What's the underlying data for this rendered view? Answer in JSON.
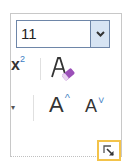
{
  "font_group": {
    "font_size": {
      "value": "11",
      "dropdown_icon": "chevron-down-icon"
    },
    "superscript": {
      "base": "x",
      "exponent": "2",
      "icon": "superscript-icon"
    },
    "clear_formatting": {
      "icon": "clear-formatting-icon",
      "glyph": "A"
    },
    "grow_font": {
      "glyph": "A",
      "caret": "^",
      "icon": "grow-font-icon"
    },
    "shrink_font": {
      "glyph": "A",
      "caret": "˅",
      "icon": "shrink-font-icon"
    },
    "dialog_launcher": {
      "icon": "dialog-launcher-icon",
      "highlight_color": "#f3c34a"
    }
  },
  "colors": {
    "accent_blue": "#4a88c7",
    "eraser_purple": "#9b4fb8",
    "dropdown_bg": "#d7e4f3"
  }
}
